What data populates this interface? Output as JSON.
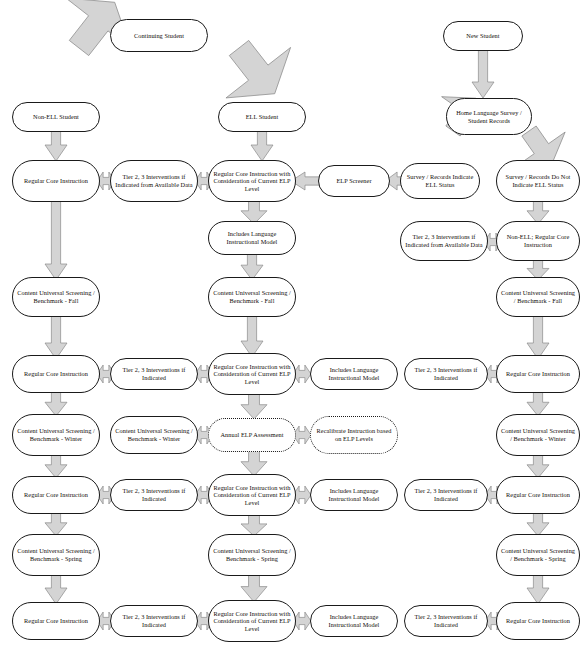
{
  "diagram": {
    "labels": {
      "continuing_student": "Continuing Student",
      "new_student": "New Student",
      "non_ell_student": "Non-ELL Student",
      "ell_student": "ELL Student",
      "home_language_survey": "Home Language Survey / Student Records",
      "survey_indicate": "Survey / Records Indicate ELL Status",
      "survey_not_indicate": "Survey / Records Do Not Indicate ELL Status",
      "elp_screener": "ELP Screener",
      "regular_core_instruction": "Regular Core Instruction",
      "regular_core_elp": "Regular Core Instruction with Consideration of Current ELP Level",
      "tier_23_available_data": "Tier 2, 3 Interventions if Indicated from Available Data",
      "tier_23_if_indicated": "Tier 2, 3 Interventions if Indicated",
      "includes_language_model": "Includes Language Instructional Model",
      "non_ell_regular_core": "Non-ELL; Regular Core Instruction",
      "content_fall": "Content Universal Screening / Benchmark - Fall",
      "content_winter": "Content Universal Screening / Benchmark - Winter",
      "content_spring": "Content Universal Screening / Benchmark - Spring",
      "annual_elp_assessment": "Annual ELP Assessment",
      "recalibrate": "Recalibrate Instruction based on ELP Levels"
    },
    "colors": {
      "node_border": "#1a1a1a",
      "node_fill": "#ffffff",
      "arrow_fill": "#d4d4d4",
      "arrow_stroke": "#8a8a8a",
      "text": "#100c08"
    },
    "nodes": [
      {
        "id": "continuing-student",
        "label_key": "continuing_student",
        "x": 110,
        "y": 19,
        "w": 98,
        "h": 33,
        "dotted": false
      },
      {
        "id": "new-student",
        "label_key": "new_student",
        "x": 443,
        "y": 21,
        "w": 80,
        "h": 30,
        "dotted": false
      },
      {
        "id": "non-ell-student",
        "label_key": "non_ell_student",
        "x": 12,
        "y": 102,
        "w": 88,
        "h": 30,
        "dotted": false
      },
      {
        "id": "ell-student",
        "label_key": "ell_student",
        "x": 218,
        "y": 102,
        "w": 88,
        "h": 30,
        "dotted": false
      },
      {
        "id": "home-language-survey",
        "label_key": "home_language_survey",
        "x": 446,
        "y": 98,
        "w": 86,
        "h": 37,
        "dotted": false
      },
      {
        "id": "rci-r1-c1",
        "label_key": "regular_core_instruction",
        "x": 12,
        "y": 160,
        "w": 88,
        "h": 42,
        "dotted": false
      },
      {
        "id": "tier-r1-c2",
        "label_key": "tier_23_available_data",
        "x": 110,
        "y": 160,
        "w": 88,
        "h": 42,
        "dotted": false
      },
      {
        "id": "rcielp-r1-c3",
        "label_key": "regular_core_elp",
        "x": 208,
        "y": 160,
        "w": 88,
        "h": 42,
        "dotted": false
      },
      {
        "id": "elp-screener",
        "label_key": "elp_screener",
        "x": 318,
        "y": 165,
        "w": 72,
        "h": 32,
        "dotted": false
      },
      {
        "id": "survey-indicate",
        "label_key": "survey_indicate",
        "x": 400,
        "y": 163,
        "w": 80,
        "h": 36,
        "dotted": false
      },
      {
        "id": "survey-not-indicate",
        "label_key": "survey_not_indicate",
        "x": 496,
        "y": 160,
        "w": 84,
        "h": 42,
        "dotted": false
      },
      {
        "id": "includes-lang-r1",
        "label_key": "includes_language_model",
        "x": 208,
        "y": 221,
        "w": 88,
        "h": 34,
        "dotted": false
      },
      {
        "id": "tier-r1b-right",
        "label_key": "tier_23_available_data",
        "x": 400,
        "y": 221,
        "w": 88,
        "h": 40,
        "dotted": false
      },
      {
        "id": "non-ell-regular",
        "label_key": "non_ell_regular_core",
        "x": 496,
        "y": 221,
        "w": 84,
        "h": 40,
        "dotted": false
      },
      {
        "id": "content-fall-c1",
        "label_key": "content_fall",
        "x": 12,
        "y": 277,
        "w": 88,
        "h": 40,
        "dotted": false
      },
      {
        "id": "content-fall-c3",
        "label_key": "content_fall",
        "x": 208,
        "y": 277,
        "w": 88,
        "h": 40,
        "dotted": false
      },
      {
        "id": "content-fall-c5",
        "label_key": "content_fall",
        "x": 496,
        "y": 277,
        "w": 84,
        "h": 40,
        "dotted": false
      },
      {
        "id": "rci-r2-c1",
        "label_key": "regular_core_instruction",
        "x": 12,
        "y": 355,
        "w": 88,
        "h": 38,
        "dotted": false
      },
      {
        "id": "tier-r2-c2",
        "label_key": "tier_23_if_indicated",
        "x": 110,
        "y": 358,
        "w": 88,
        "h": 32,
        "dotted": false
      },
      {
        "id": "rcielp-r2-c3",
        "label_key": "regular_core_elp",
        "x": 208,
        "y": 353,
        "w": 88,
        "h": 42,
        "dotted": false
      },
      {
        "id": "includes-lang-r2",
        "label_key": "includes_language_model",
        "x": 310,
        "y": 358,
        "w": 88,
        "h": 32,
        "dotted": false
      },
      {
        "id": "tier-r2-c5",
        "label_key": "tier_23_if_indicated",
        "x": 404,
        "y": 358,
        "w": 84,
        "h": 32,
        "dotted": false
      },
      {
        "id": "rci-r2-c6",
        "label_key": "regular_core_instruction",
        "x": 496,
        "y": 355,
        "w": 84,
        "h": 38,
        "dotted": false
      },
      {
        "id": "content-winter-c1",
        "label_key": "content_winter",
        "x": 12,
        "y": 414,
        "w": 88,
        "h": 42,
        "dotted": false
      },
      {
        "id": "content-winter-c2",
        "label_key": "content_winter",
        "x": 110,
        "y": 416,
        "w": 88,
        "h": 38,
        "dotted": false
      },
      {
        "id": "annual-elp",
        "label_key": "annual_elp_assessment",
        "x": 208,
        "y": 418,
        "w": 88,
        "h": 34,
        "dotted": true
      },
      {
        "id": "recalibrate",
        "label_key": "recalibrate",
        "x": 310,
        "y": 416,
        "w": 88,
        "h": 38,
        "dotted": true
      },
      {
        "id": "content-winter-c6",
        "label_key": "content_winter",
        "x": 496,
        "y": 414,
        "w": 84,
        "h": 42,
        "dotted": false
      },
      {
        "id": "rci-r3-c1",
        "label_key": "regular_core_instruction",
        "x": 12,
        "y": 476,
        "w": 88,
        "h": 38,
        "dotted": false
      },
      {
        "id": "tier-r3-c2",
        "label_key": "tier_23_if_indicated",
        "x": 110,
        "y": 479,
        "w": 88,
        "h": 32,
        "dotted": false
      },
      {
        "id": "rcielp-r3-c3",
        "label_key": "regular_core_elp",
        "x": 208,
        "y": 474,
        "w": 88,
        "h": 42,
        "dotted": false
      },
      {
        "id": "includes-lang-r3",
        "label_key": "includes_language_model",
        "x": 310,
        "y": 479,
        "w": 88,
        "h": 32,
        "dotted": false
      },
      {
        "id": "tier-r3-c5",
        "label_key": "tier_23_if_indicated",
        "x": 404,
        "y": 479,
        "w": 84,
        "h": 32,
        "dotted": false
      },
      {
        "id": "rci-r3-c6",
        "label_key": "regular_core_instruction",
        "x": 496,
        "y": 476,
        "w": 84,
        "h": 38,
        "dotted": false
      },
      {
        "id": "content-spring-c1",
        "label_key": "content_spring",
        "x": 12,
        "y": 534,
        "w": 88,
        "h": 42,
        "dotted": false
      },
      {
        "id": "content-spring-c3",
        "label_key": "content_spring",
        "x": 208,
        "y": 534,
        "w": 88,
        "h": 42,
        "dotted": false
      },
      {
        "id": "content-spring-c6",
        "label_key": "content_spring",
        "x": 496,
        "y": 534,
        "w": 84,
        "h": 42,
        "dotted": false
      },
      {
        "id": "rci-r4-c1",
        "label_key": "regular_core_instruction",
        "x": 12,
        "y": 602,
        "w": 88,
        "h": 38,
        "dotted": false
      },
      {
        "id": "tier-r4-c2",
        "label_key": "tier_23_if_indicated",
        "x": 110,
        "y": 605,
        "w": 88,
        "h": 32,
        "dotted": false
      },
      {
        "id": "rcielp-r4-c3",
        "label_key": "regular_core_elp",
        "x": 208,
        "y": 600,
        "w": 88,
        "h": 42,
        "dotted": false
      },
      {
        "id": "includes-lang-r4",
        "label_key": "includes_language_model",
        "x": 310,
        "y": 605,
        "w": 88,
        "h": 32,
        "dotted": false
      },
      {
        "id": "tier-r4-c5",
        "label_key": "tier_23_if_indicated",
        "x": 404,
        "y": 605,
        "w": 84,
        "h": 32,
        "dotted": false
      },
      {
        "id": "rci-r4-c6",
        "label_key": "regular_core_instruction",
        "x": 496,
        "y": 602,
        "w": 84,
        "h": 38,
        "dotted": false
      }
    ],
    "arrows": [
      {
        "id": "a-cont-left",
        "kind": "diag",
        "x": 38,
        "y": 48,
        "w": 82,
        "h": 58,
        "rot": 218
      },
      {
        "id": "a-cont-right",
        "kind": "diag",
        "x": 198,
        "y": 48,
        "w": 82,
        "h": 58,
        "rot": -38
      },
      {
        "id": "a-new-down",
        "kind": "down",
        "x": 472,
        "y": 50,
        "w": 22,
        "h": 48
      },
      {
        "id": "a-nonell-down",
        "kind": "down",
        "x": 45,
        "y": 131,
        "w": 22,
        "h": 30
      },
      {
        "id": "a-ell-down",
        "kind": "down",
        "x": 251,
        "y": 131,
        "w": 22,
        "h": 30
      },
      {
        "id": "a-hls-left",
        "kind": "diag",
        "x": 424,
        "y": 131,
        "w": 58,
        "h": 40,
        "rot": 215
      },
      {
        "id": "a-hls-right",
        "kind": "diag",
        "x": 500,
        "y": 131,
        "w": 58,
        "h": 40,
        "rot": -35
      },
      {
        "id": "a-r1-c1c2",
        "kind": "bi-h",
        "x": 97,
        "y": 172,
        "w": 18,
        "h": 18
      },
      {
        "id": "a-r1-c2c3",
        "kind": "bi-h",
        "x": 195,
        "y": 172,
        "w": 18,
        "h": 18
      },
      {
        "id": "a-screener-to-rcielp",
        "kind": "left",
        "x": 291,
        "y": 172,
        "w": 30,
        "h": 18
      },
      {
        "id": "a-survey-to-screener",
        "kind": "left",
        "x": 385,
        "y": 172,
        "w": 22,
        "h": 18
      },
      {
        "id": "a-rcielp-down-1",
        "kind": "down",
        "x": 241,
        "y": 200,
        "w": 26,
        "h": 24
      },
      {
        "id": "a-surveynot-down",
        "kind": "down",
        "x": 527,
        "y": 200,
        "w": 22,
        "h": 24
      },
      {
        "id": "a-r1b-tier-nonell",
        "kind": "bi-h",
        "x": 484,
        "y": 233,
        "w": 18,
        "h": 18
      },
      {
        "id": "a-c1-long-down",
        "kind": "down-long",
        "x": 45,
        "y": 200,
        "w": 22,
        "h": 80
      },
      {
        "id": "a-incl-down",
        "kind": "down",
        "x": 241,
        "y": 253,
        "w": 22,
        "h": 27
      },
      {
        "id": "a-nonellreg-down",
        "kind": "down",
        "x": 527,
        "y": 259,
        "w": 22,
        "h": 21
      },
      {
        "id": "a-fall-c1-down",
        "kind": "down",
        "x": 45,
        "y": 315,
        "w": 22,
        "h": 44
      },
      {
        "id": "a-fall-c3-down",
        "kind": "down",
        "x": 241,
        "y": 315,
        "w": 22,
        "h": 42
      },
      {
        "id": "a-fall-c5-down",
        "kind": "down",
        "x": 527,
        "y": 315,
        "w": 22,
        "h": 44
      },
      {
        "id": "a-r2-c1c2",
        "kind": "bi-h",
        "x": 97,
        "y": 365,
        "w": 18,
        "h": 18
      },
      {
        "id": "a-r2-c2c3",
        "kind": "bi-h",
        "x": 195,
        "y": 365,
        "w": 18,
        "h": 18
      },
      {
        "id": "a-r2-c3c4",
        "kind": "bi-h",
        "x": 293,
        "y": 365,
        "w": 18,
        "h": 18
      },
      {
        "id": "a-r2-c5c6",
        "kind": "bi-h",
        "x": 485,
        "y": 365,
        "w": 18,
        "h": 18
      },
      {
        "id": "a-r2-c1-down",
        "kind": "down",
        "x": 45,
        "y": 391,
        "w": 22,
        "h": 25
      },
      {
        "id": "a-r2-c3-down",
        "kind": "down",
        "x": 241,
        "y": 393,
        "w": 26,
        "h": 26
      },
      {
        "id": "a-r2-c6-down",
        "kind": "down",
        "x": 527,
        "y": 391,
        "w": 22,
        "h": 25
      },
      {
        "id": "a-win-c2c3",
        "kind": "bi-h",
        "x": 195,
        "y": 426,
        "w": 18,
        "h": 18
      },
      {
        "id": "a-win-c3c4",
        "kind": "bi-h",
        "x": 293,
        "y": 426,
        "w": 18,
        "h": 18
      },
      {
        "id": "a-win-c1-down",
        "kind": "down",
        "x": 45,
        "y": 454,
        "w": 22,
        "h": 24
      },
      {
        "id": "a-win-c3-down",
        "kind": "down",
        "x": 241,
        "y": 450,
        "w": 26,
        "h": 26
      },
      {
        "id": "a-win-c6-down",
        "kind": "down",
        "x": 527,
        "y": 454,
        "w": 22,
        "h": 24
      },
      {
        "id": "a-r3-c1c2",
        "kind": "bi-h",
        "x": 97,
        "y": 486,
        "w": 18,
        "h": 18
      },
      {
        "id": "a-r3-c2c3",
        "kind": "bi-h",
        "x": 195,
        "y": 486,
        "w": 18,
        "h": 18
      },
      {
        "id": "a-r3-c3c4",
        "kind": "bi-h",
        "x": 293,
        "y": 486,
        "w": 18,
        "h": 18
      },
      {
        "id": "a-r3-c5c6",
        "kind": "bi-h",
        "x": 485,
        "y": 486,
        "w": 18,
        "h": 18
      },
      {
        "id": "a-r3-c1-down",
        "kind": "down",
        "x": 45,
        "y": 512,
        "w": 22,
        "h": 24
      },
      {
        "id": "a-r3-c3-down",
        "kind": "down",
        "x": 241,
        "y": 514,
        "w": 26,
        "h": 22
      },
      {
        "id": "a-r3-c6-down",
        "kind": "down",
        "x": 527,
        "y": 512,
        "w": 22,
        "h": 24
      },
      {
        "id": "a-spr-c1-down",
        "kind": "down",
        "x": 45,
        "y": 574,
        "w": 22,
        "h": 30
      },
      {
        "id": "a-spr-c3-down",
        "kind": "down",
        "x": 241,
        "y": 574,
        "w": 26,
        "h": 28
      },
      {
        "id": "a-spr-c6-down",
        "kind": "down",
        "x": 527,
        "y": 574,
        "w": 22,
        "h": 30
      },
      {
        "id": "a-r4-c1c2",
        "kind": "bi-h",
        "x": 97,
        "y": 612,
        "w": 18,
        "h": 18
      },
      {
        "id": "a-r4-c2c3",
        "kind": "bi-h",
        "x": 195,
        "y": 612,
        "w": 18,
        "h": 18
      },
      {
        "id": "a-r4-c3c4",
        "kind": "bi-h",
        "x": 293,
        "y": 612,
        "w": 18,
        "h": 18
      },
      {
        "id": "a-r4-c5c6",
        "kind": "bi-h",
        "x": 485,
        "y": 612,
        "w": 18,
        "h": 18
      }
    ]
  }
}
